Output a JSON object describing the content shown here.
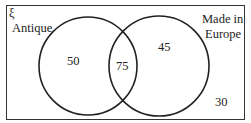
{
  "diagram": {
    "type": "venn",
    "universal_symbol": "ξ",
    "sets": [
      {
        "name": "Antique",
        "only_value": "50"
      },
      {
        "name": "Made in Europe",
        "name_line1": "Made in",
        "name_line2": "Europe",
        "only_value": "45"
      }
    ],
    "intersection_value": "75",
    "outside_value": "30",
    "stroke_color": "#222222"
  }
}
